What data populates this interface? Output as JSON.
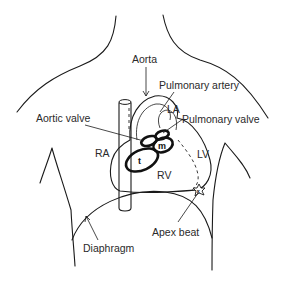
{
  "diagram": {
    "labels": {
      "aorta": "Aorta",
      "pulmonary_artery": "Pulmonary artery",
      "la": "LA",
      "aortic_valve": "Aortic valve",
      "pulmonary_valve": "Pulmonary valve",
      "ra": "RA",
      "lv": "LV",
      "rv": "RV",
      "apex_beat": "Apex beat",
      "diaphragm": "Diaphragm",
      "tricuspid_marker": "t",
      "mitral_marker": "m",
      "apex_marker": "x"
    }
  }
}
